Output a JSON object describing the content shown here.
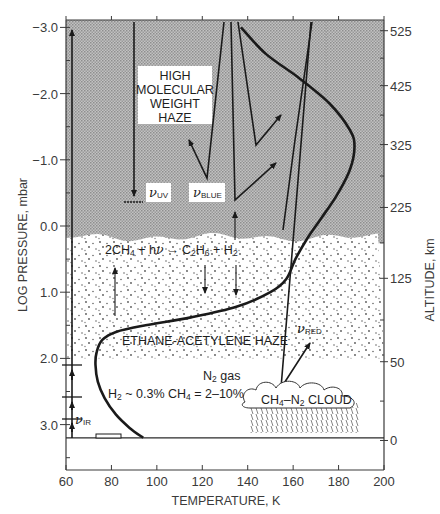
{
  "chart_data": {
    "type": "diagram",
    "title": "",
    "xlabel": "TEMPERATURE, K",
    "ylabel_left": "LOG PRESSURE, mbar",
    "ylabel_right": "ALTITUDE, km",
    "xlim": [
      60,
      200
    ],
    "ylim_left": [
      3.5,
      -3.1
    ],
    "x_ticks": [
      "60",
      "80",
      "100",
      "120",
      "140",
      "160",
      "180",
      "200"
    ],
    "x_tick_values": [
      60,
      80,
      100,
      120,
      140,
      160,
      180,
      200
    ],
    "y_ticks_left": [
      "−3.0",
      "−2.0",
      "−1.0",
      "0.0",
      "1.0",
      "2.0",
      "3.0"
    ],
    "y_tick_values_left": [
      -3.0,
      -2.0,
      -1.0,
      0.0,
      1.0,
      2.0,
      3.0
    ],
    "y_ticks_right": [
      "525",
      "425",
      "325",
      "225",
      "125",
      "50",
      "0"
    ],
    "y_tick_values_right_logp": [
      -2.95,
      -2.12,
      -1.23,
      -0.28,
      0.79,
      2.05,
      3.24
    ],
    "ground_logp": 3.2,
    "temperature_profile": {
      "name": "Temperature profile",
      "points": [
        [
          94,
          3.2
        ],
        [
          88,
          3.05
        ],
        [
          82,
          2.85
        ],
        [
          77,
          2.6
        ],
        [
          74,
          2.35
        ],
        [
          73,
          2.1
        ],
        [
          73.5,
          1.9
        ],
        [
          76,
          1.72
        ],
        [
          82,
          1.6
        ],
        [
          95,
          1.5
        ],
        [
          115,
          1.38
        ],
        [
          135,
          1.22
        ],
        [
          150,
          1.0
        ],
        [
          157,
          0.8
        ],
        [
          161,
          0.5
        ],
        [
          166,
          0.2
        ],
        [
          172,
          -0.1
        ],
        [
          179,
          -0.45
        ],
        [
          185,
          -0.85
        ],
        [
          187,
          -1.2
        ],
        [
          185,
          -1.45
        ],
        [
          176,
          -1.85
        ],
        [
          162,
          -2.25
        ],
        [
          148,
          -2.6
        ],
        [
          137,
          -3.0
        ]
      ]
    },
    "regions": [
      {
        "name": "High molecular weight haze",
        "from_logp": -3.1,
        "to_logp": 0.2,
        "pattern": "crosshatch-gray"
      },
      {
        "name": "Ethane-acetylene haze",
        "from_logp": 0.2,
        "to_logp": 2.0,
        "pattern": "stipple"
      },
      {
        "name": "Clear N2 gas layer",
        "from_logp": 2.0,
        "to_logp": 3.2,
        "pattern": "none"
      }
    ]
  },
  "labels": {
    "haze_high": [
      "HIGH",
      "MOLECULAR",
      "WEIGHT",
      "HAZE"
    ],
    "reaction": {
      "lhs": "2CH",
      "lhs_sub": "4",
      "plus1": " + h",
      "nu": "ν",
      "arrow": "→",
      "c2": "C",
      "c2_sub1": "2",
      "h6": "H",
      "c2_sub2": "6",
      "plus2": " + H",
      "h2_sub": "2"
    },
    "ethane_haze": "ETHANE-ACETYLENE HAZE",
    "n2_gas": "N",
    "n2_sub": "2",
    "n2_gas_suffix": " gas",
    "composition_h": "H",
    "composition_h_sub": "2",
    "composition_mid": " ~ 0.3% CH",
    "composition_ch_sub": "4",
    "composition_tail": " = 2–10%",
    "cloud_ch": "CH",
    "cloud_ch_sub": "4",
    "cloud_n": "–N",
    "cloud_n_sub": "2",
    "cloud_tail": " CLOUD",
    "nu_symbol": "ν",
    "nu_uv_sub": "UV",
    "nu_blue_sub": "BLUE",
    "nu_red_sub": "RED",
    "nu_ir_sub": "IR"
  },
  "colors": {
    "haze_fill": "#b4b4b4",
    "curve": "#1a1a1a",
    "axis": "#3a3a3a",
    "label_box": "#ffffff"
  }
}
